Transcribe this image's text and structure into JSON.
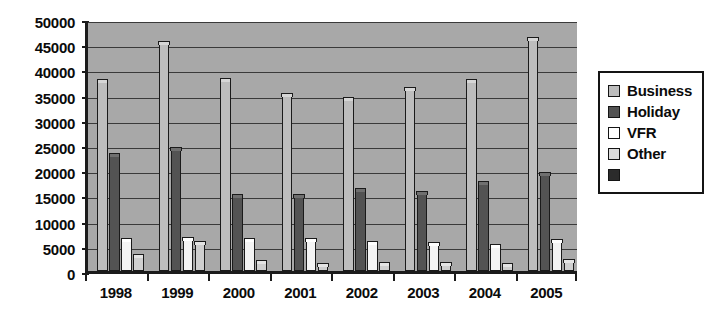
{
  "chart_data": {
    "type": "bar",
    "title": "",
    "subtitle": "",
    "xlabel": "",
    "ylabel": "",
    "categories": [
      "1998",
      "1999",
      "2000",
      "2001",
      "2002",
      "2003",
      "2004",
      "2005"
    ],
    "ylim": [
      0,
      50000
    ],
    "ytick_step": 5000,
    "ytick_labels": [
      "0",
      "5000",
      "10000",
      "15000",
      "20000",
      "25000",
      "30000",
      "35000",
      "40000",
      "45000",
      "50000"
    ],
    "ytick_values": [
      0,
      5000,
      10000,
      15000,
      20000,
      25000,
      30000,
      35000,
      40000,
      45000,
      50000
    ],
    "grid": true,
    "grid_axis": "y",
    "legend_position": "right",
    "plot_background": "#a8a8a8",
    "page_background": "#ffffff",
    "series": [
      {
        "name": "Business",
        "color": "#bdbdbd",
        "values": [
          37500,
          45000,
          37800,
          34800,
          34000,
          36000,
          37500,
          45800
        ]
      },
      {
        "name": "Holiday",
        "color": "#535353",
        "values": [
          22800,
          24000,
          14700,
          14600,
          15800,
          15200,
          17300,
          19000
        ]
      },
      {
        "name": "VFR",
        "color": "#ffffff",
        "values": [
          6000,
          6200,
          6000,
          6000,
          5300,
          5200,
          4700,
          5700
        ]
      },
      {
        "name": "Other",
        "color": "#dcdcdc",
        "values": [
          2800,
          5300,
          1500,
          900,
          1100,
          1200,
          1000,
          1800
        ]
      },
      {
        "name": "",
        "color": "#2b2b2b",
        "values": [
          0,
          0,
          0,
          0,
          0,
          0,
          0,
          0
        ]
      }
    ]
  },
  "legend": {
    "items": [
      {
        "label": "Business",
        "swatch_class": "sw-business"
      },
      {
        "label": "Holiday",
        "swatch_class": "sw-holiday"
      },
      {
        "label": "VFR",
        "swatch_class": "sw-vfr"
      },
      {
        "label": "Other",
        "swatch_class": "sw-other"
      },
      {
        "label": "",
        "swatch_class": "sw-fifth"
      }
    ]
  }
}
